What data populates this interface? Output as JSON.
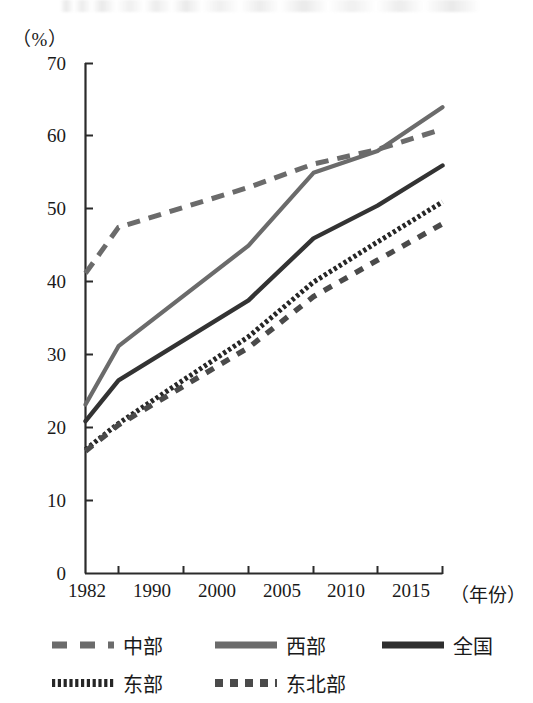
{
  "chart_data": {
    "type": "line",
    "title": "",
    "xlabel": "（年份）",
    "ylabel": "（%）",
    "ylim": [
      0,
      70
    ],
    "ytick_values": [
      70,
      60,
      50,
      40,
      30,
      20,
      10,
      0
    ],
    "ytick_labels": [
      "70",
      "60",
      "50",
      "40",
      "30",
      "20",
      "10",
      "0"
    ],
    "categories": [
      "1982",
      "1990",
      "2000",
      "2005",
      "2010",
      "2015"
    ],
    "x": [
      1982,
      1990,
      2000,
      2005,
      2010,
      2015
    ],
    "grid": false,
    "legend_position": "bottom",
    "series": [
      {
        "name": "中部",
        "style": "dashed",
        "color": "#6b6b6b",
        "values": [
          41.2,
          47.5,
          53.0,
          56.2,
          58.2,
          61.0
        ]
      },
      {
        "name": "西部",
        "style": "solid",
        "color": "#6b6b6b",
        "values": [
          23.2,
          31.2,
          45.0,
          55.0,
          58.0,
          64.0
        ]
      },
      {
        "name": "全国",
        "style": "solid",
        "color": "#333333",
        "values": [
          20.9,
          26.5,
          37.5,
          46.0,
          50.5,
          56.0
        ]
      },
      {
        "name": "东部",
        "style": "dotted",
        "color": "#262626",
        "values": [
          17.0,
          20.6,
          32.5,
          40.0,
          45.5,
          51.0
        ]
      },
      {
        "name": "东北部",
        "style": "square-dashed",
        "color": "#4a4a4a",
        "values": [
          16.8,
          20.4,
          31.0,
          38.0,
          43.0,
          48.0
        ]
      }
    ]
  },
  "axis": {
    "y_unit": "（%）",
    "x_title": "（年份）"
  },
  "legend": {
    "rows": [
      [
        {
          "label": "中部",
          "style": "dashed"
        },
        {
          "label": "西部",
          "style": "solid-gray"
        },
        {
          "label": "全国",
          "style": "solid-dark"
        }
      ],
      [
        {
          "label": "东部",
          "style": "dotted"
        },
        {
          "label": "东北部",
          "style": "square-dashed"
        }
      ]
    ]
  },
  "colors": {
    "axis": "#2b2b2b",
    "gray_line": "#6b6b6b",
    "dark_line": "#2e2e2e"
  }
}
